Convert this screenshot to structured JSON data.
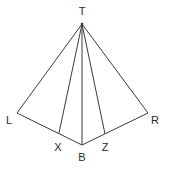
{
  "diagram": {
    "type": "geometry",
    "points": {
      "T": {
        "label": "T",
        "x": 82,
        "y": 24,
        "lx": 82,
        "ly": 15
      },
      "L": {
        "label": "L",
        "x": 17,
        "y": 113,
        "lx": 9,
        "ly": 124
      },
      "X": {
        "label": "X",
        "x": 59,
        "y": 133,
        "lx": 58,
        "ly": 151
      },
      "B": {
        "label": "B",
        "x": 82,
        "y": 145,
        "lx": 82,
        "ly": 161
      },
      "Z": {
        "label": "Z",
        "x": 105,
        "y": 134,
        "lx": 105,
        "ly": 151
      },
      "R": {
        "label": "R",
        "x": 148,
        "y": 113,
        "lx": 155,
        "ly": 124
      }
    },
    "segments": [
      [
        "T",
        "L"
      ],
      [
        "T",
        "X"
      ],
      [
        "T",
        "B"
      ],
      [
        "T",
        "Z"
      ],
      [
        "T",
        "R"
      ],
      [
        "L",
        "B"
      ],
      [
        "B",
        "R"
      ]
    ],
    "labels": {
      "T": "T",
      "L": "L",
      "X": "X",
      "B": "B",
      "Z": "Z",
      "R": "R"
    }
  }
}
